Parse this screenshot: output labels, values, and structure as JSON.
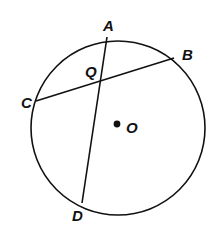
{
  "diagram": {
    "type": "circle-intersecting-chords",
    "circle": {
      "center_label": "O",
      "cx": 118,
      "cy": 128,
      "r": 87
    },
    "points": {
      "A": {
        "label": "A",
        "x": 107,
        "y": 37
      },
      "B": {
        "label": "B",
        "x": 174,
        "y": 58
      },
      "C": {
        "label": "C",
        "x": 36,
        "y": 101
      },
      "D": {
        "label": "D",
        "x": 82,
        "y": 203
      },
      "Q": {
        "label": "Q"
      },
      "O": {
        "label": "O",
        "x": 117,
        "y": 124
      }
    },
    "chords": [
      "AD",
      "CB"
    ],
    "intersection": "Q",
    "stroke_color": "#111111"
  }
}
